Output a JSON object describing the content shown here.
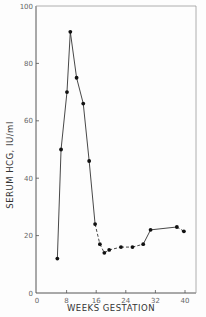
{
  "chart_data": {
    "type": "line",
    "title": "",
    "xlabel": "WEEKS GESTATION",
    "ylabel": "SERUM HCG, IU/ml",
    "xlim": [
      0,
      42
    ],
    "ylim": [
      0,
      100
    ],
    "x_ticks": [
      0,
      8,
      16,
      24,
      32,
      40
    ],
    "y_ticks": [
      0,
      20,
      40,
      60,
      80,
      100
    ],
    "grid": false,
    "legend": null,
    "series": [
      {
        "name": "Serum HCG",
        "marker": "filled-circle",
        "x": [
          5.5,
          6.5,
          8.1,
          9.0,
          10.7,
          12.5,
          14.1,
          15.7,
          17.0,
          18.2,
          19.5,
          22.7,
          25.8,
          28.7,
          30.7,
          37.8,
          39.7
        ],
        "y": [
          12,
          50,
          70,
          91,
          75,
          66,
          46,
          24,
          17,
          14,
          15,
          16,
          16,
          17,
          22,
          23,
          21.5
        ],
        "line_style": [
          "solid",
          "solid",
          "solid",
          "solid",
          "solid",
          "solid",
          "solid",
          "dashed",
          "dashed",
          "dashed",
          "dashed",
          "dashed",
          "dashed",
          "solid",
          "solid",
          "dashed"
        ]
      }
    ]
  },
  "colors": {
    "line": "#333333",
    "axis": "#555555",
    "background": "#fdfdfd"
  }
}
